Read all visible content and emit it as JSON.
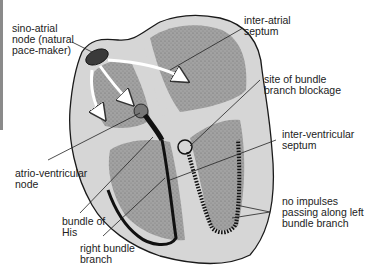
{
  "diagram": {
    "type": "anatomical-illustration",
    "colors": {
      "background": "#ffffff",
      "heart_wall": "#d6d6d6",
      "chamber_fill": "#9a9a9a",
      "conduction_path": "#111111",
      "outline": "#1a1a1a",
      "label_text": "#222222"
    },
    "labels": [
      {
        "id": "sino-atrial",
        "text": "sino-atrial\nnode (natural\npace-maker)"
      },
      {
        "id": "inter-atrial",
        "text": "inter-atrial\nseptum"
      },
      {
        "id": "blockage",
        "text": "site of bundle\nbranch blockage"
      },
      {
        "id": "inter-ventricular",
        "text": "inter-ventricular\nseptum"
      },
      {
        "id": "atrio-ventricular",
        "text": "atrio-ventricular\nnode"
      },
      {
        "id": "no-impulses",
        "text": "no impulses\npassing along left\nbundle branch"
      },
      {
        "id": "bundle-his",
        "text": "bundle of\nHis"
      },
      {
        "id": "right-bundle",
        "text": "right bundle\nbranch"
      }
    ]
  }
}
